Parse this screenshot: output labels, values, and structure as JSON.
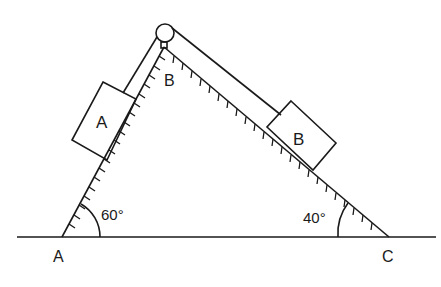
{
  "diagram": {
    "type": "inclined-planes-pulley",
    "labels": {
      "point_a": "A",
      "point_b": "B",
      "point_c": "C",
      "block_a": "A",
      "block_b": "B",
      "angle_left": "60°",
      "angle_right": "40°"
    },
    "colors": {
      "stroke": "#1a1a1a",
      "background": "#ffffff"
    }
  }
}
